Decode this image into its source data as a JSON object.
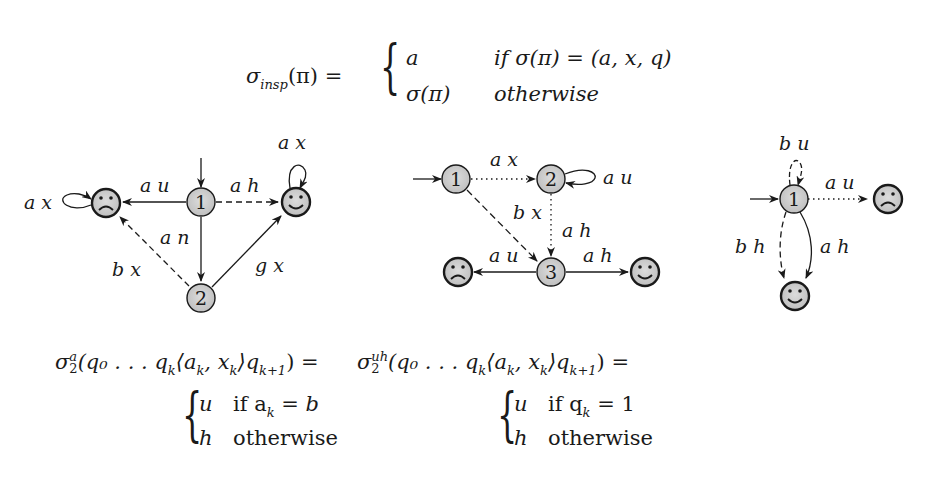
{
  "formula_top": {
    "lhs": "σ",
    "lhs_sub": "insp",
    "lhs_arg": "(π) =",
    "case1_value": "a",
    "case1_cond": "if σ(π) = (a, x, q)",
    "case2_value": "σ(π)",
    "case2_cond": "otherwise"
  },
  "diagrams": [
    {
      "id": "left",
      "nodes": [
        {
          "id": "1",
          "label": "1",
          "type": "state",
          "initial": true
        },
        {
          "id": "2",
          "label": "2",
          "type": "state"
        },
        {
          "id": "sad",
          "label": "",
          "type": "sad-face"
        },
        {
          "id": "happy",
          "label": "",
          "type": "happy-face"
        }
      ],
      "edges": [
        {
          "from": "1",
          "to": "sad",
          "label": "a u",
          "style": "solid"
        },
        {
          "from": "1",
          "to": "happy",
          "label": "a h",
          "style": "dashed"
        },
        {
          "from": "1",
          "to": "2",
          "label": "a n",
          "style": "solid"
        },
        {
          "from": "2",
          "to": "sad",
          "label": "b x",
          "style": "dashed"
        },
        {
          "from": "2",
          "to": "happy",
          "label": "g x",
          "style": "solid"
        },
        {
          "from": "sad",
          "to": "sad",
          "label": "a x",
          "style": "solid"
        },
        {
          "from": "happy",
          "to": "happy",
          "label": "a x",
          "style": "solid"
        }
      ]
    },
    {
      "id": "middle",
      "nodes": [
        {
          "id": "1",
          "label": "1",
          "type": "state",
          "initial": true
        },
        {
          "id": "2",
          "label": "2",
          "type": "state"
        },
        {
          "id": "3",
          "label": "3",
          "type": "state"
        },
        {
          "id": "sad",
          "label": "",
          "type": "sad-face"
        },
        {
          "id": "happy",
          "label": "",
          "type": "happy-face"
        }
      ],
      "edges": [
        {
          "from": "1",
          "to": "2",
          "label": "a x",
          "style": "dotted"
        },
        {
          "from": "2",
          "to": "2",
          "label": "a u",
          "style": "solid"
        },
        {
          "from": "1",
          "to": "3",
          "label": "b x",
          "style": "dashed"
        },
        {
          "from": "2",
          "to": "3",
          "label": "a h",
          "style": "dotted"
        },
        {
          "from": "3",
          "to": "sad",
          "label": "a u",
          "style": "solid"
        },
        {
          "from": "3",
          "to": "happy",
          "label": "a h",
          "style": "solid"
        }
      ]
    },
    {
      "id": "right",
      "nodes": [
        {
          "id": "1",
          "label": "1",
          "type": "state",
          "initial": true
        },
        {
          "id": "sad",
          "label": "",
          "type": "sad-face"
        },
        {
          "id": "happy",
          "label": "",
          "type": "happy-face"
        }
      ],
      "edges": [
        {
          "from": "1",
          "to": "1",
          "label": "b u",
          "style": "dashed"
        },
        {
          "from": "1",
          "to": "sad",
          "label": "a u",
          "style": "dotted"
        },
        {
          "from": "1",
          "to": "happy",
          "label": "b h",
          "style": "dashed"
        },
        {
          "from": "1",
          "to": "happy",
          "label": "a h",
          "style": "solid"
        }
      ]
    }
  ],
  "formula_left": {
    "lhs": "σ",
    "sup": "a",
    "sub": "2",
    "arg": "(q₀ . . . q",
    "arg_k": "k",
    "arg_pair": "⟨a",
    "arg_pair_k": "k",
    "arg_comma": ", x",
    "arg_x_k": "k",
    "arg_close": "⟩q",
    "arg_k1": "k+1",
    "eq": ") =",
    "case1_value": "u",
    "case1_cond_prefix": "if a",
    "case1_cond_sub": "k",
    "case1_cond_suffix": " = b",
    "case2_value": "h",
    "case2_cond": "otherwise"
  },
  "formula_right": {
    "lhs": "σ",
    "sup": "uh",
    "sub": "2",
    "arg": "(q₀ . . . q",
    "arg_k": "k",
    "arg_pair": "⟨a",
    "arg_pair_k": "k",
    "arg_comma": ", x",
    "arg_x_k": "k",
    "arg_close": "⟩q",
    "arg_k1": "k+1",
    "eq": ") =",
    "case1_value": "u",
    "case1_cond_prefix": "if q",
    "case1_cond_sub": "k",
    "case1_cond_suffix": " = 1",
    "case2_value": "h",
    "case2_cond": "otherwise"
  },
  "colors": {
    "node_fill": "#cfcfcf",
    "stroke": "#1a1a1a",
    "background": "#ffffff"
  }
}
